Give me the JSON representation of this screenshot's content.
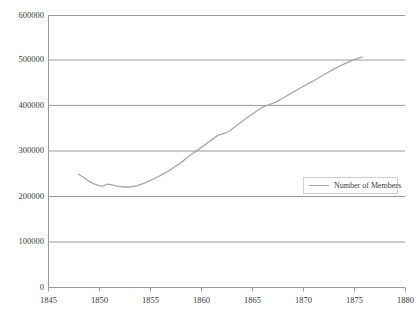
{
  "chart_data": {
    "type": "line",
    "title": "",
    "subtitle": "",
    "xlabel": "",
    "ylabel": "",
    "xlim": [
      1845,
      1880
    ],
    "ylim": [
      0,
      600000
    ],
    "grid": "horizontal",
    "legend_position": "inside-right",
    "x_ticks": [
      "1845",
      "1850",
      "1855",
      "1860",
      "1865",
      "1870",
      "1875",
      "1880"
    ],
    "y_ticks": [
      "0",
      "100000",
      "200000",
      "300000",
      "400000",
      "500000",
      "600000"
    ],
    "series": [
      {
        "name": "Number of Members",
        "color": "#a8a8a8",
        "x": [
          1848.0,
          1848.5,
          1849.0,
          1849.5,
          1850.0,
          1850.3,
          1850.8,
          1851.2,
          1851.8,
          1852.5,
          1853.0,
          1853.8,
          1854.5,
          1855.2,
          1856.0,
          1857.0,
          1858.0,
          1859.0,
          1859.6,
          1860.3,
          1861.0,
          1861.7,
          1862.3,
          1862.8,
          1863.5,
          1864.3,
          1865.0,
          1866.0,
          1866.8,
          1867.3,
          1868.0,
          1869.0,
          1870.0,
          1871.0,
          1872.0,
          1873.0,
          1874.0,
          1875.0,
          1875.8
        ],
        "y": [
          250000,
          243000,
          235000,
          229000,
          225000,
          224000,
          228000,
          227000,
          224000,
          222000,
          222000,
          225000,
          231000,
          238000,
          247000,
          260000,
          275000,
          293000,
          302000,
          313000,
          325000,
          336000,
          340000,
          345000,
          357000,
          371000,
          382000,
          397000,
          404000,
          408000,
          417000,
          430000,
          443000,
          455000,
          468000,
          481000,
          492000,
          502000,
          508000
        ]
      }
    ],
    "annotations": []
  },
  "legend": {
    "entries": [
      {
        "label": "Number of Members",
        "swatch": "line-swatch"
      }
    ]
  },
  "axes": {
    "y_tick_labels": [
      "600000",
      "500000",
      "400000",
      "300000",
      "200000",
      "100000",
      "0"
    ],
    "x_tick_labels": [
      "1845",
      "1850",
      "1855",
      "1860",
      "1865",
      "1870",
      "1875",
      "1880"
    ]
  },
  "colors": {
    "series_line": "#a8a8a8",
    "gridline": "#9a9a9a",
    "axis": "#9a9a9a",
    "tick_text": "#3a3a3a",
    "legend_border": "#cfcfcf",
    "background": "#ffffff"
  }
}
